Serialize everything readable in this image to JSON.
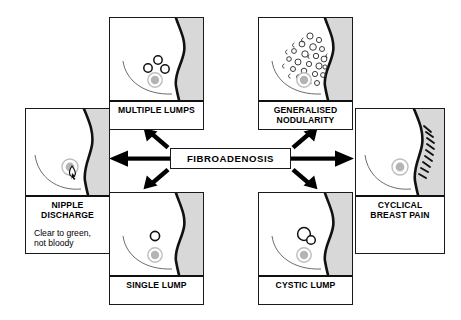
{
  "diagram": {
    "title": "FIBROADENOSIS",
    "center": {
      "label": "FIBROADENOSIS"
    },
    "colors": {
      "outline": "#111111",
      "body_shade": "#d8d8d8",
      "nipple_fill": "#b4b4b4",
      "nipple_ring": "#bdbdbd",
      "background": "#ffffff",
      "text": "#000000"
    },
    "panels": [
      {
        "id": "multiple-lumps",
        "caption": "MULTIPLE LUMPS",
        "sub": "",
        "feature": "three small open lumps clustered above the nipple"
      },
      {
        "id": "generalised-nodularity",
        "caption": "GENERALISED NODULARITY",
        "caption_line1": "GENERALISED",
        "caption_line2": "NODULARITY",
        "sub": "",
        "feature": "many small nodules and squiggles spread through the breast"
      },
      {
        "id": "nipple-discharge",
        "caption": "NIPPLE DISCHARGE",
        "caption_line1": "NIPPLE",
        "caption_line2": "DISCHARGE",
        "sub_line1": "Clear to green,",
        "sub_line2": "not bloody",
        "feature": "droplet emerging at the nipple"
      },
      {
        "id": "cyclical-breast-pain",
        "caption": "CYCLICAL BREAST PAIN",
        "caption_line1": "CYCLICAL",
        "caption_line2": "BREAST PAIN",
        "sub": "",
        "feature": "radiating pain strokes along the breast contour"
      },
      {
        "id": "single-lump",
        "caption": "SINGLE LUMP",
        "sub": "",
        "feature": "one open lump above the nipple"
      },
      {
        "id": "cystic-lump",
        "caption": "CYSTIC LUMP",
        "sub": "",
        "feature": "two overlapping open cysts above the nipple"
      }
    ],
    "arrows": [
      {
        "id": "arrow-to-multiple-lumps",
        "direction": "up-left"
      },
      {
        "id": "arrow-to-generalised-nodularity",
        "direction": "up-right"
      },
      {
        "id": "arrow-to-nipple-discharge",
        "direction": "left"
      },
      {
        "id": "arrow-to-cyclical-breast-pain",
        "direction": "right"
      },
      {
        "id": "arrow-to-single-lump",
        "direction": "down-left"
      },
      {
        "id": "arrow-to-cystic-lump",
        "direction": "down-right"
      }
    ]
  }
}
